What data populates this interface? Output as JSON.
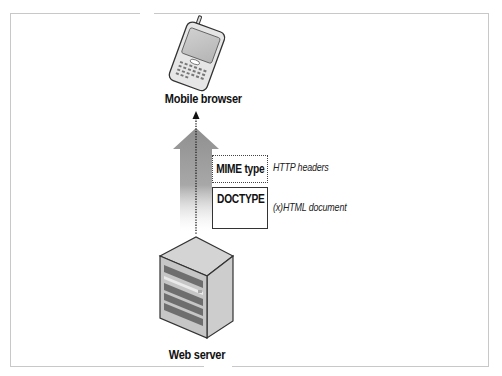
{
  "diagram": {
    "nodes": {
      "client": {
        "label": "Mobile browser",
        "icon": "mobile-phone-icon"
      },
      "server": {
        "label": "Web server",
        "icon": "server-icon"
      }
    },
    "payload": {
      "mime_box": {
        "label": "MIME type",
        "annotation": "HTTP headers",
        "border": "dotted"
      },
      "doctype_box": {
        "label": "DOCTYPE",
        "annotation": "(x)HTML document",
        "border": "solid"
      }
    },
    "flow": {
      "direction": "server-to-client",
      "arrow_color": "#9a9a9a"
    }
  }
}
